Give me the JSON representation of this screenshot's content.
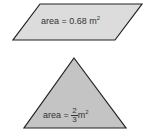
{
  "shapes": {
    "parallelogram": {
      "label_prefix": "area = ",
      "value": "0.68",
      "unit": "m",
      "exponent": "2",
      "fill": "#dcdcdc",
      "stroke": "#222222"
    },
    "triangle": {
      "label_prefix": "area = ",
      "numerator": "2",
      "denominator": "3",
      "unit": "m",
      "exponent": "2",
      "fill": "#c4c4c4",
      "stroke": "#222222"
    }
  }
}
